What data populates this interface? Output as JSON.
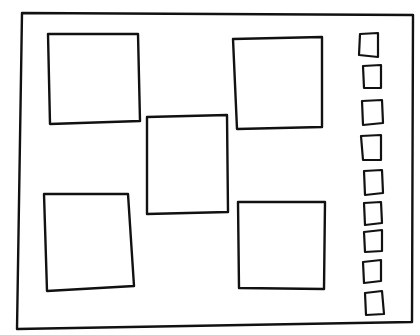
{
  "sketch": {
    "type": "hand-drawn wireframe",
    "stroke_color": "#111111",
    "background": "#ffffff",
    "frame": {
      "points": "22,13 413,15 412,322 17,329"
    },
    "content_boxes": [
      {
        "id": "box-top-left",
        "points": "48,34 138,34 140,121 50,124"
      },
      {
        "id": "box-center",
        "points": "147,117 227,115 228,212 147,214"
      },
      {
        "id": "box-top-right",
        "points": "233,39 322,37 322,127 237,129"
      },
      {
        "id": "box-bottom-left",
        "points": "44,194 128,194 134,286 47,291"
      },
      {
        "id": "box-bottom-right",
        "points": "238,202 325,202 324,289 239,288"
      }
    ],
    "thumbnail_count": 9,
    "thumbnails": [
      {
        "points": "360,34 378,33 378,57 359,55"
      },
      {
        "points": "363,66 381,65 381,88 364,88"
      },
      {
        "points": "362,101 382,100 383,123 363,125"
      },
      {
        "points": "361,136 381,135 381,160 363,160"
      },
      {
        "points": "364,171 382,170 383,193 365,195"
      },
      {
        "points": "364,203 381,202 382,223 365,225"
      },
      {
        "points": "364,232 382,230 382,251 365,252"
      },
      {
        "points": "363,262 381,260 381,281 364,283"
      },
      {
        "points": "365,293 382,291 384,314 366,315"
      }
    ]
  }
}
